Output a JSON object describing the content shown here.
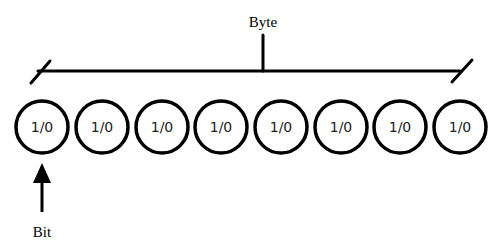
{
  "diagram": {
    "byte_label": "Byte",
    "bit_label": "Bit",
    "bits": [
      {
        "value": "1/0"
      },
      {
        "value": "1/0"
      },
      {
        "value": "1/0"
      },
      {
        "value": "1/0"
      },
      {
        "value": "1/0"
      },
      {
        "value": "1/0"
      },
      {
        "value": "1/0"
      },
      {
        "value": "1/0"
      }
    ],
    "bit_count": 8,
    "colors": {
      "stroke": "#000000",
      "background": "#ffffff"
    }
  }
}
